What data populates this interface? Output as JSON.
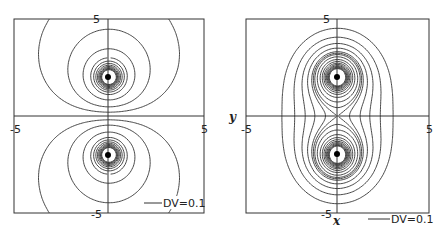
{
  "chart_data": [
    {
      "type": "contour",
      "title": "",
      "description": "Equipotential lines of two opposite charges (dipole) on the y-axis",
      "xlabel": "",
      "ylabel": "",
      "xlim": [
        -5,
        5
      ],
      "ylim": [
        -5,
        5
      ],
      "tick_labels": {
        "x": [
          "-5",
          "5"
        ],
        "y": [
          "5",
          "-5"
        ]
      },
      "charges": [
        {
          "x": 0,
          "y": 2,
          "sign": 1
        },
        {
          "x": 0,
          "y": -2,
          "sign": -1
        }
      ],
      "legend": "DV=0.1",
      "contour_step": 0.1
    },
    {
      "type": "contour",
      "title": "",
      "description": "Equipotential lines of two like charges on the y-axis",
      "xlabel": "x",
      "ylabel": "y",
      "xlim": [
        -5,
        5
      ],
      "ylim": [
        -5,
        5
      ],
      "tick_labels": {
        "x": [
          "-5",
          "5"
        ],
        "y": [
          "5",
          "-5"
        ]
      },
      "charges": [
        {
          "x": 0,
          "y": 2,
          "sign": 1
        },
        {
          "x": 0,
          "y": -2,
          "sign": 1
        }
      ],
      "legend": "DV=0.1",
      "contour_step": 0.1
    }
  ],
  "plots": [
    {
      "legend": "DV=0.1",
      "xmin": "-5",
      "xmax": "5",
      "ymax": "5",
      "ymin": "-5"
    },
    {
      "legend": "DV=0.1",
      "xmin": "-5",
      "xmax": "5",
      "ymax": "5",
      "ymin": "-5",
      "xlabel": "x",
      "ylabel": "y"
    }
  ]
}
